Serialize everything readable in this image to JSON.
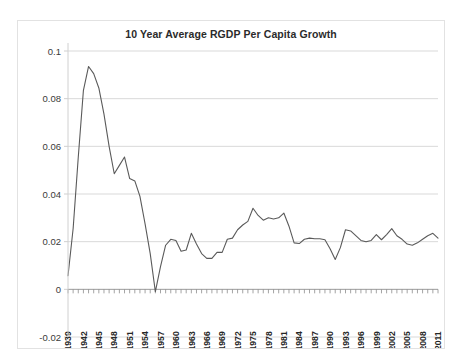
{
  "chart_data": {
    "type": "line",
    "title": "10 Year Average RGDP Per Capita Growth",
    "xlabel": "",
    "ylabel": "",
    "ylim": [
      -0.02,
      0.1
    ],
    "xlim": [
      1939,
      2011
    ],
    "grid": true,
    "legend": false,
    "y_ticks": [
      "0.1",
      "0.08",
      "0.06",
      "0.04",
      "0.02",
      "0",
      "-0.02"
    ],
    "y_tick_values": [
      0.1,
      0.08,
      0.06,
      0.04,
      0.02,
      0,
      -0.02
    ],
    "x_tick_labels": [
      "1939",
      "1942",
      "1945",
      "1948",
      "1951",
      "1954",
      "1957",
      "1960",
      "1963",
      "1966",
      "1969",
      "1972",
      "1975",
      "1978",
      "1981",
      "1984",
      "1987",
      "1990",
      "1993",
      "1996",
      "1999",
      "2002",
      "2005",
      "2008",
      "2011"
    ],
    "x_tick_step": 3,
    "line_color": "#5a5a5a",
    "grid_color": "#d9d9d9",
    "series": [
      {
        "name": "10 Year Average RGDP Per Capita Growth",
        "x": [
          1939,
          1940,
          1941,
          1942,
          1943,
          1944,
          1945,
          1946,
          1947,
          1948,
          1949,
          1950,
          1951,
          1952,
          1953,
          1954,
          1955,
          1956,
          1957,
          1958,
          1959,
          1960,
          1961,
          1962,
          1963,
          1964,
          1965,
          1966,
          1967,
          1968,
          1969,
          1970,
          1971,
          1972,
          1973,
          1974,
          1975,
          1976,
          1977,
          1978,
          1979,
          1980,
          1981,
          1982,
          1983,
          1984,
          1985,
          1986,
          1987,
          1988,
          1989,
          1990,
          1991,
          1992,
          1993,
          1994,
          1995,
          1996,
          1997,
          1998,
          1999,
          2000,
          2001,
          2002,
          2003,
          2004,
          2005,
          2006,
          2007,
          2008,
          2009,
          2010,
          2011
        ],
        "values": [
          0.0057,
          0.0255,
          0.0555,
          0.0835,
          0.0935,
          0.0905,
          0.0845,
          0.0735,
          0.06,
          0.0485,
          0.052,
          0.0555,
          0.0465,
          0.0455,
          0.039,
          0.0275,
          0.015,
          -0.001,
          0.0095,
          0.0185,
          0.021,
          0.0205,
          0.016,
          0.0165,
          0.0235,
          0.019,
          0.015,
          0.013,
          0.013,
          0.0155,
          0.0155,
          0.021,
          0.0215,
          0.025,
          0.027,
          0.0285,
          0.034,
          0.031,
          0.029,
          0.03,
          0.0295,
          0.03,
          0.032,
          0.0265,
          0.0195,
          0.0192,
          0.021,
          0.0215,
          0.0212,
          0.0212,
          0.0208,
          0.017,
          0.0125,
          0.0175,
          0.025,
          0.0245,
          0.0225,
          0.0205,
          0.02,
          0.0205,
          0.023,
          0.0208,
          0.023,
          0.0255,
          0.0225,
          0.021,
          0.019,
          0.0185,
          0.0195,
          0.021,
          0.0225,
          0.0235,
          0.0215
        ]
      }
    ]
  }
}
